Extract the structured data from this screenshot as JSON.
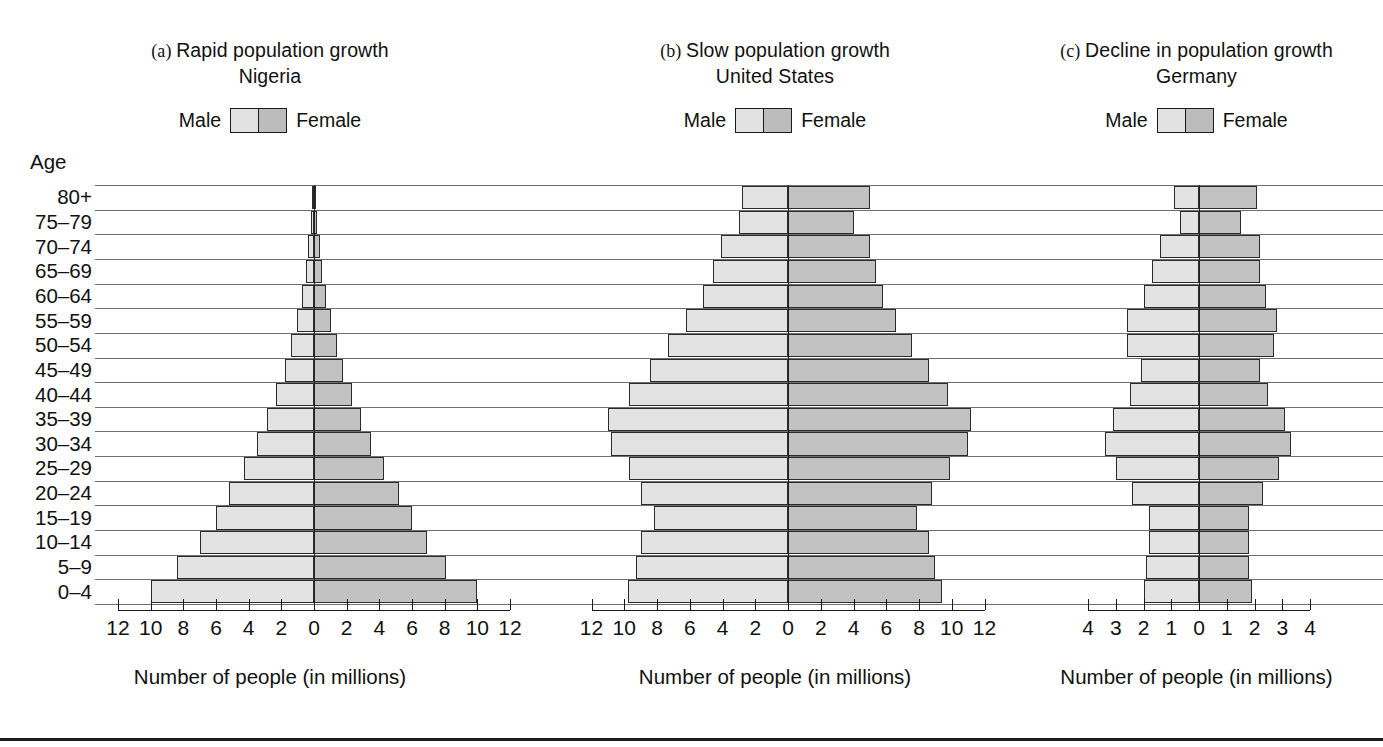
{
  "figure": {
    "x_caption": "Number of people (in millions)",
    "age_axis_label": "Age",
    "legend": {
      "male": "Male",
      "female": "Female"
    },
    "colors": {
      "male": "#e3e3e3",
      "female": "#c2c2c2",
      "outline": "#2b2b2b",
      "grid": "#6f6f6f"
    }
  },
  "age_groups": [
    "80+",
    "75–79",
    "70–74",
    "65–69",
    "60–64",
    "55–59",
    "50–54",
    "45–49",
    "40–44",
    "35–39",
    "30–34",
    "25–29",
    "20–24",
    "15–19",
    "10–14",
    "5–9",
    "0–4"
  ],
  "panels": [
    {
      "tag": "(a)",
      "title": "Rapid population growth",
      "country": "Nigeria",
      "x_ticks": [
        12,
        10,
        8,
        6,
        4,
        2,
        0,
        2,
        4,
        6,
        8,
        10,
        12
      ],
      "x_max": 12
    },
    {
      "tag": "(b)",
      "title": "Slow population growth",
      "country": "United States",
      "x_ticks": [
        12,
        10,
        8,
        6,
        4,
        2,
        0,
        2,
        4,
        6,
        8,
        10,
        12
      ],
      "x_max": 12
    },
    {
      "tag": "(c)",
      "title": "Decline in population growth",
      "country": "Germany",
      "x_ticks": [
        4,
        3,
        2,
        1,
        0,
        1,
        2,
        3,
        4
      ],
      "x_max": 4
    }
  ],
  "chart_data": [
    {
      "type": "bar",
      "title": "(a) Rapid population growth — Nigeria",
      "subtitle": "Nigeria",
      "xlabel": "Number of people (in millions)",
      "ylabel": "Age",
      "xlim": [
        -12,
        12
      ],
      "grid": true,
      "legend_position": "top-center",
      "categories": [
        "80+",
        "75–79",
        "70–74",
        "65–69",
        "60–64",
        "55–59",
        "50–54",
        "45–49",
        "40–44",
        "35–39",
        "30–34",
        "25–29",
        "20–24",
        "15–19",
        "10–14",
        "5–9",
        "0–4"
      ],
      "series": [
        {
          "name": "Male",
          "values": [
            0.1,
            0.2,
            0.35,
            0.5,
            0.75,
            1.05,
            1.4,
            1.8,
            2.3,
            2.85,
            3.5,
            4.3,
            5.2,
            6.0,
            7.0,
            8.4,
            10.0
          ]
        },
        {
          "name": "Female",
          "values": [
            0.1,
            0.2,
            0.35,
            0.5,
            0.75,
            1.05,
            1.4,
            1.8,
            2.3,
            2.85,
            3.5,
            4.3,
            5.2,
            6.0,
            6.9,
            8.1,
            10.0
          ]
        }
      ]
    },
    {
      "type": "bar",
      "title": "(b) Slow population growth — United States",
      "subtitle": "United States",
      "xlabel": "Number of people (in millions)",
      "ylabel": "Age",
      "xlim": [
        -12,
        12
      ],
      "grid": true,
      "legend_position": "top-center",
      "categories": [
        "80+",
        "75–79",
        "70–74",
        "65–69",
        "60–64",
        "55–59",
        "50–54",
        "45–49",
        "40–44",
        "35–39",
        "30–34",
        "25–29",
        "20–24",
        "15–19",
        "10–14",
        "5–9",
        "0–4"
      ],
      "series": [
        {
          "name": "Male",
          "values": [
            2.8,
            3.0,
            4.1,
            4.6,
            5.2,
            6.2,
            7.3,
            8.4,
            9.7,
            11.0,
            10.8,
            9.7,
            9.0,
            8.2,
            9.0,
            9.3,
            9.8
          ]
        },
        {
          "name": "Female",
          "values": [
            5.0,
            4.0,
            5.0,
            5.4,
            5.8,
            6.6,
            7.6,
            8.6,
            9.8,
            11.2,
            11.0,
            9.9,
            8.8,
            7.9,
            8.6,
            9.0,
            9.4
          ]
        }
      ]
    },
    {
      "type": "bar",
      "title": "(c) Decline in population growth — Germany",
      "subtitle": "Germany",
      "xlabel": "Number of people (in millions)",
      "ylabel": "Age",
      "xlim": [
        -4,
        4
      ],
      "grid": true,
      "legend_position": "top-center",
      "categories": [
        "80+",
        "75–79",
        "70–74",
        "65–69",
        "60–64",
        "55–59",
        "50–54",
        "45–49",
        "40–44",
        "35–39",
        "30–34",
        "25–29",
        "20–24",
        "15–19",
        "10–14",
        "5–9",
        "0–4"
      ],
      "series": [
        {
          "name": "Male",
          "values": [
            0.9,
            0.7,
            1.4,
            1.7,
            2.0,
            2.6,
            2.6,
            2.1,
            2.5,
            3.1,
            3.4,
            3.0,
            2.4,
            1.8,
            1.8,
            1.9,
            2.0
          ]
        },
        {
          "name": "Female",
          "values": [
            2.1,
            1.5,
            2.2,
            2.2,
            2.4,
            2.8,
            2.7,
            2.2,
            2.5,
            3.1,
            3.3,
            2.9,
            2.3,
            1.8,
            1.8,
            1.8,
            1.9
          ]
        }
      ]
    }
  ]
}
